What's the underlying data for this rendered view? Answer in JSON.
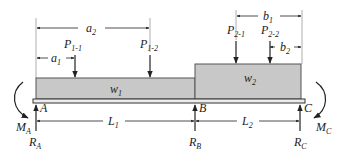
{
  "diagram": {
    "type": "continuous-beam-loading",
    "colors": {
      "load_fill": "#c8c8c8",
      "line": "#222222",
      "beam_fill": "#e6e6e6"
    },
    "dimensions": {
      "a1": {
        "main": "a",
        "sub": "1"
      },
      "a2": {
        "main": "a",
        "sub": "2"
      },
      "b1": {
        "main": "b",
        "sub": "1"
      },
      "b2": {
        "main": "b",
        "sub": "2"
      },
      "L1": {
        "main": "L",
        "sub": "1"
      },
      "L2": {
        "main": "L",
        "sub": "2"
      }
    },
    "point_loads": [
      {
        "main": "P",
        "sub": "1-1"
      },
      {
        "main": "P",
        "sub": "1-2"
      },
      {
        "main": "P",
        "sub": "2-1"
      },
      {
        "main": "P",
        "sub": "2-2"
      }
    ],
    "distributed_loads": [
      {
        "main": "w",
        "sub": "1"
      },
      {
        "main": "w",
        "sub": "2"
      }
    ],
    "supports": [
      {
        "point": "A",
        "reaction_main": "R",
        "reaction_sub": "A",
        "moment_main": "M",
        "moment_sub": "A"
      },
      {
        "point": "B",
        "reaction_main": "R",
        "reaction_sub": "B"
      },
      {
        "point": "C",
        "reaction_main": "R",
        "reaction_sub": "C",
        "moment_main": "M",
        "moment_sub": "C"
      }
    ]
  }
}
